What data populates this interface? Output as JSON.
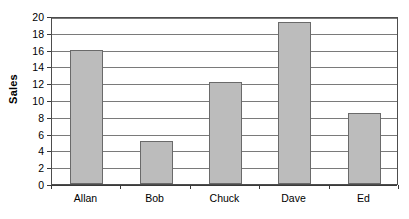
{
  "chart_data": {
    "type": "bar",
    "title": "",
    "subtitle": "",
    "xlabel": "",
    "ylabel": "Sales",
    "categories": [
      "Allan",
      "Bob",
      "Chuck",
      "Dave",
      "Ed"
    ],
    "values": [
      16.0,
      5.1,
      12.2,
      19.3,
      8.4
    ],
    "series": [
      {
        "name": "Sales",
        "values": [
          16.0,
          5.1,
          12.2,
          19.3,
          8.4
        ]
      }
    ],
    "ylim": [
      0,
      20
    ],
    "ytick_step": 2,
    "ytick_labels": [
      "0",
      "2",
      "4",
      "6",
      "8",
      "10",
      "12",
      "14",
      "16",
      "18",
      "20"
    ],
    "xtick_labels": [
      "Allan",
      "Bob",
      "Chuck",
      "Dave",
      "Ed"
    ],
    "grid": true,
    "grid_axis": "y",
    "legend": false,
    "legend_position": "none",
    "bar_fill_color": "#bcbcbc",
    "bar_border_color": "#6a6a6a",
    "gridline_color": "#7a7a7a",
    "axis_color": "#3a3a3a",
    "plot_border_color": "#4d4d4d",
    "background_color": "#ffffff",
    "text_color": "#000000"
  }
}
